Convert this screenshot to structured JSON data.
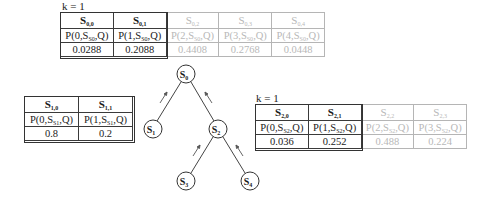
{
  "top_table": {
    "k_label": "k = 1",
    "columns": [
      {
        "header": "S",
        "header_sub": "0,0",
        "prob_pre": "P(0,S",
        "prob_sub": "S0",
        "prob_post": ",Q)",
        "value": "0.0288",
        "active": true
      },
      {
        "header": "S",
        "header_sub": "0,1",
        "prob_pre": "P(1,S",
        "prob_sub": "S0",
        "prob_post": ",Q)",
        "value": "0.2088",
        "active": true
      },
      {
        "header": "S",
        "header_sub": "0,2",
        "prob_pre": "P(2,S",
        "prob_sub": "S0",
        "prob_post": ",Q)",
        "value": "0.4408",
        "active": false
      },
      {
        "header": "S",
        "header_sub": "0,3",
        "prob_pre": "P(3,S",
        "prob_sub": "S0",
        "prob_post": ",Q)",
        "value": "0.2768",
        "active": false
      },
      {
        "header": "S",
        "header_sub": "0,4",
        "prob_pre": "P(4,S",
        "prob_sub": "S0",
        "prob_post": ",Q)",
        "value": "0.0448",
        "active": false
      }
    ]
  },
  "left_table": {
    "columns": [
      {
        "header": "S",
        "header_sub": "1,0",
        "prob_pre": "P(0,S",
        "prob_sub": "S1",
        "prob_post": ",Q)",
        "value": "0.8",
        "active": true
      },
      {
        "header": "S",
        "header_sub": "1,1",
        "prob_pre": "P(1,S",
        "prob_sub": "S1",
        "prob_post": ",Q)",
        "value": "0.2",
        "active": true
      }
    ]
  },
  "right_table": {
    "k_label": "k = 1",
    "columns": [
      {
        "header": "S",
        "header_sub": "2,0",
        "prob_pre": "P(0,S",
        "prob_sub": "S2",
        "prob_post": ",Q)",
        "value": "0.036",
        "active": true
      },
      {
        "header": "S",
        "header_sub": "2,1",
        "prob_pre": "P(1,S",
        "prob_sub": "S2",
        "prob_post": ",Q)",
        "value": "0.252",
        "active": true
      },
      {
        "header": "S",
        "header_sub": "2,2",
        "prob_pre": "P(2,S",
        "prob_sub": "S2",
        "prob_post": ",Q)",
        "value": "0.488",
        "active": false
      },
      {
        "header": "S",
        "header_sub": "2,3",
        "prob_pre": "P(3,S",
        "prob_sub": "S2",
        "prob_post": ",Q)",
        "value": "0.224",
        "active": false
      }
    ]
  },
  "tree": {
    "nodes": [
      {
        "id": "S0",
        "label": "S",
        "sub": "0"
      },
      {
        "id": "S1",
        "label": "S",
        "sub": "1"
      },
      {
        "id": "S2",
        "label": "S",
        "sub": "2"
      },
      {
        "id": "S3",
        "label": "S",
        "sub": "3"
      },
      {
        "id": "S4",
        "label": "S",
        "sub": "4"
      }
    ]
  },
  "colors": {
    "active_text": "#1a1a1a",
    "dim_text": "#b8b8b8",
    "active_border": "#333333",
    "dim_border": "#b5b5b5"
  }
}
